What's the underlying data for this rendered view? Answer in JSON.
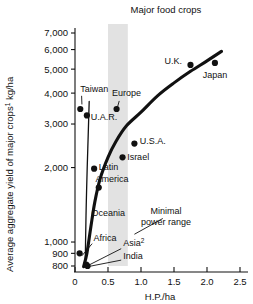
{
  "chart_data": {
    "type": "scatter",
    "title": "Major food crops",
    "xlabel": "H.P./ha",
    "ylabel": "Average aggregate yield of major crops¹  kg/ha",
    "ylabel_main": "Average aggregate yield of major crops",
    "ylabel_sup": "1",
    "ylabel_unit": "kg/ha",
    "yscale": "log",
    "ylim": [
      780,
      7400
    ],
    "xlim": [
      -0.08,
      2.62
    ],
    "grid": false,
    "legend": null,
    "xticks": [
      0,
      0.5,
      1.0,
      1.5,
      2.0,
      2.5
    ],
    "xticklabels": [
      "0",
      "0.5",
      "1.0",
      "1.5",
      "2.0",
      "2.5"
    ],
    "yticks": [
      800,
      900,
      1000,
      2000,
      3000,
      4000,
      5000,
      6000,
      7000
    ],
    "yticklabels": [
      "800",
      "900",
      "1,000",
      "2,000",
      "3,000",
      "4,000",
      "5,000",
      "6,000",
      "7,000"
    ],
    "points": [
      {
        "name": "Taiwan",
        "x": 0.08,
        "y": 3450,
        "label": "Taiwan",
        "lx": 0.08,
        "ly": 4050,
        "anchor": "start"
      },
      {
        "name": "U.A.R.",
        "x": 0.18,
        "y": 3250,
        "label": "U.A.R.",
        "lx": 0.24,
        "ly": 3120,
        "anchor": "start"
      },
      {
        "name": "Europe",
        "x": 0.63,
        "y": 3450,
        "label": "Europe",
        "lx": 0.56,
        "ly": 3880,
        "anchor": "start"
      },
      {
        "name": "U.S.A.",
        "x": 0.9,
        "y": 2500,
        "label": "U.S.A.",
        "lx": 0.98,
        "ly": 2480,
        "anchor": "start"
      },
      {
        "name": "Israel",
        "x": 0.72,
        "y": 2200,
        "label": "Israel",
        "lx": 0.79,
        "ly": 2150,
        "anchor": "start"
      },
      {
        "name": "U.K.",
        "x": 1.75,
        "y": 5200,
        "label": "U.K.",
        "lx": 1.62,
        "ly": 5250,
        "anchor": "end"
      },
      {
        "name": "Japan",
        "x": 2.12,
        "y": 5300,
        "label": "Japan",
        "lx": 2.12,
        "ly": 4600,
        "anchor": "middle"
      },
      {
        "name": "Latin America",
        "x": 0.29,
        "y": 1980,
        "label": "Latin",
        "lx": 0.36,
        "ly": 1960,
        "anchor": "start"
      },
      {
        "name": "Oceania",
        "x": 0.36,
        "y": 1660,
        "label": "Oceania",
        "lx": 0.25,
        "ly": 1280,
        "anchor": "start"
      },
      {
        "name": "Africa",
        "x": 0.07,
        "y": 900,
        "label": "Africa",
        "lx": 0.28,
        "ly": 1010,
        "anchor": "start"
      },
      {
        "name": "Asia",
        "x": 0.17,
        "y": 810,
        "label": "Asia",
        "lx": 0.73,
        "ly": 960,
        "anchor": "start"
      },
      {
        "name": "India",
        "x": 0.19,
        "y": 800,
        "label": "India",
        "lx": 0.73,
        "ly": 855,
        "anchor": "start"
      }
    ],
    "label_secondary": [
      {
        "name": "America",
        "text": "America",
        "lx": 0.31,
        "ly": 1745
      }
    ],
    "annotations": [
      {
        "name": "minimal-power-range",
        "line1": "Minimal",
        "line2": "power range",
        "lx": 1.38,
        "ly": 1300
      }
    ],
    "shaded_band": {
      "name": "minimal-power-range-band",
      "x0": 0.5,
      "x1": 0.8,
      "color": "#e2e2e2"
    },
    "curve_main": [
      [
        0.13,
        795
      ],
      [
        0.18,
        900
      ],
      [
        0.24,
        1150
      ],
      [
        0.3,
        1450
      ],
      [
        0.38,
        1800
      ],
      [
        0.5,
        2200
      ],
      [
        0.62,
        2550
      ],
      [
        0.78,
        2950
      ],
      [
        1.0,
        3350
      ],
      [
        1.25,
        3900
      ],
      [
        1.5,
        4400
      ],
      [
        1.75,
        4900
      ],
      [
        2.0,
        5400
      ],
      [
        2.22,
        5900
      ]
    ],
    "curve_thin": [
      [
        0.155,
        790
      ],
      [
        0.16,
        1000
      ],
      [
        0.17,
        1400
      ],
      [
        0.185,
        2000
      ],
      [
        0.2,
        2700
      ],
      [
        0.215,
        3700
      ]
    ],
    "leader_lines": [
      {
        "name": "taiwan-leader",
        "x1": 0.1,
        "y1": 3900,
        "x2": 0.105,
        "y2": 3600
      },
      {
        "name": "europe-leader",
        "x1": 0.67,
        "y1": 3720,
        "x2": 0.645,
        "y2": 3520
      },
      {
        "name": "africa-leader",
        "x1": 0.26,
        "y1": 985,
        "x2": 0.105,
        "y2": 880
      },
      {
        "name": "asia-leader",
        "x1": 0.7,
        "y1": 940,
        "x2": 0.215,
        "y2": 808
      },
      {
        "name": "india-leader",
        "x1": 0.7,
        "y1": 845,
        "x2": 0.225,
        "y2": 798
      },
      {
        "name": "power-range-leader",
        "x1": 1.33,
        "y1": 1245,
        "x2": 0.9,
        "y2": 1075
      }
    ]
  }
}
